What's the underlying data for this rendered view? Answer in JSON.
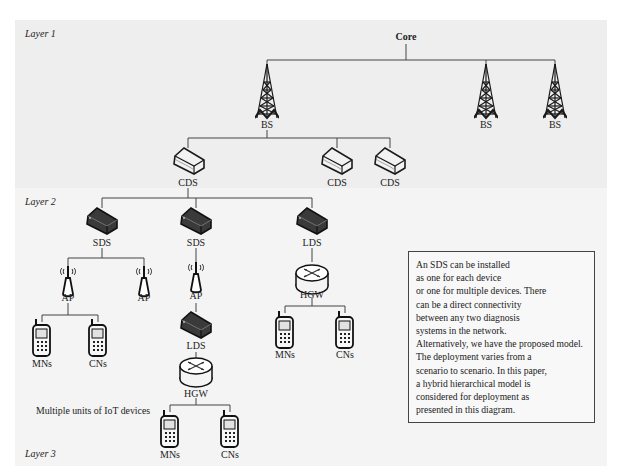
{
  "diagram": {
    "layers": [
      {
        "id": "layer1",
        "label": "Layer 1"
      },
      {
        "id": "layer2",
        "label": "Layer 2"
      },
      {
        "id": "layer3",
        "label": "Layer 3"
      }
    ],
    "core": {
      "label": "Core"
    },
    "base_stations": [
      {
        "label": "BS"
      },
      {
        "label": "BS"
      },
      {
        "label": "BS"
      }
    ],
    "cds_nodes": [
      {
        "label": "CDS"
      },
      {
        "label": "CDS"
      },
      {
        "label": "CDS"
      }
    ],
    "layer2_nodes": [
      {
        "label": "SDS"
      },
      {
        "label": "SDS"
      },
      {
        "label": "LDS"
      }
    ],
    "left_branch": {
      "access_points": [
        {
          "label": "AP"
        },
        {
          "label": "AP"
        }
      ],
      "devices": [
        {
          "label": "MNs"
        },
        {
          "label": "CNs"
        }
      ]
    },
    "middle_branch": {
      "access_point": {
        "label": "AP"
      },
      "lds": {
        "label": "LDS"
      },
      "gateway": {
        "label": "HGW"
      },
      "devices": [
        {
          "label": "MNs"
        },
        {
          "label": "CNs"
        }
      ],
      "caption": "Multiple units of IoT devices"
    },
    "right_branch": {
      "gateway": {
        "label": "HGW"
      },
      "devices": [
        {
          "label": "MNs"
        },
        {
          "label": "CNs"
        }
      ]
    },
    "note_lines": [
      "An SDS can be installed",
      "as one for each device",
      "or one for multiple devices. There",
      "can be a direct connectivity",
      "between any two diagnosis",
      "systems in the network.",
      "Alternatively, we have the proposed model.",
      "The deployment varies from a",
      "scenario to scenario. In this paper,",
      "a hybrid hierarchical model is",
      "considered for deployment as",
      "presented in this diagram."
    ],
    "colors": {
      "layer1_bg": "#eeeeee",
      "layer23_bg": "#f4f4f4",
      "line": "#444444"
    }
  }
}
